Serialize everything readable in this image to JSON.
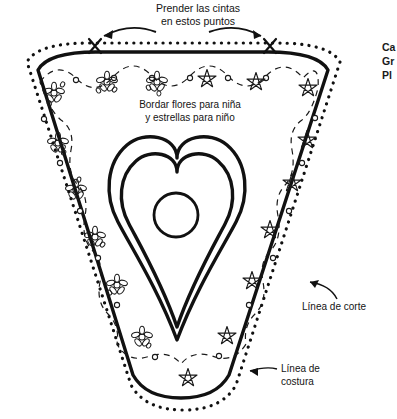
{
  "document": {
    "title": "Patrón de babero",
    "language": "es"
  },
  "annotations": {
    "top_note": {
      "line1": "Prender las cintas",
      "line2": "en estos puntos"
    },
    "center_note": {
      "line1": "Bordar flores para niña",
      "line2": "y estrellas para niño"
    },
    "cut_line_label": "Línea de corte",
    "seam_line_label": {
      "line1": "Línea de",
      "line2": "costura"
    },
    "right_margin_truncated": {
      "line1": "Ca",
      "line2": "Gr",
      "line3": "Pl"
    }
  },
  "legend": {
    "cut_line_style": "dotted",
    "seam_line_style": "solid-thick",
    "embroidery_line_style": "dashed-scallop"
  },
  "colors": {
    "ink": "#111111",
    "paper": "#ffffff",
    "text": "#141414"
  },
  "motifs": {
    "flower_side": "left",
    "star_side": "right",
    "flower_count": 8,
    "star_count": 9,
    "flower_icon": "flower-icon",
    "star_icon": "star-icon"
  },
  "markers": {
    "ribbon_points": [
      {
        "label": "x-mark-left",
        "x": 95,
        "y": 46
      },
      {
        "label": "x-mark-right",
        "x": 270,
        "y": 46
      }
    ]
  },
  "shapes": {
    "outline": "rounded-triangle",
    "inner_motif": "double-heart-with-circle"
  }
}
